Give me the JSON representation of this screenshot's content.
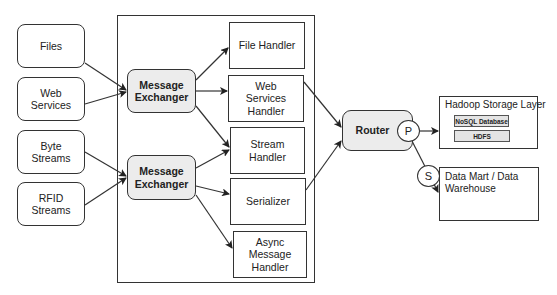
{
  "sources": [
    {
      "id": "files",
      "label": "Files"
    },
    {
      "id": "web-services",
      "label": "Web Services"
    },
    {
      "id": "byte-streams",
      "label": "Byte Streams"
    },
    {
      "id": "rfid-streams",
      "label": "RFID Streams"
    }
  ],
  "exchangers": [
    {
      "id": "message-exchanger-1",
      "label": "Message Exchanger"
    },
    {
      "id": "message-exchanger-2",
      "label": "Message Exchanger"
    }
  ],
  "handlers": [
    {
      "id": "file-handler",
      "label": "File Handler"
    },
    {
      "id": "web-services-handler",
      "label": "Web Services Handler"
    },
    {
      "id": "stream-handler",
      "label": "Stream Handler"
    },
    {
      "id": "serializer",
      "label": "Serializer"
    },
    {
      "id": "async-message-handler",
      "label": "Async Message Handler"
    }
  ],
  "router": {
    "label": "Router",
    "primary_port": "P",
    "secondary_port": "S"
  },
  "destinations": {
    "hadoop": {
      "title": "Hadoop Storage Layer",
      "items": [
        "NoSQL Database",
        "HDFS"
      ]
    },
    "datamart": {
      "title": "Data Mart / Data Warehouse"
    }
  },
  "colors": {
    "stroke": "#333333",
    "fill_highlight": "#ececec",
    "fill_sub": "#e4e4e4"
  }
}
